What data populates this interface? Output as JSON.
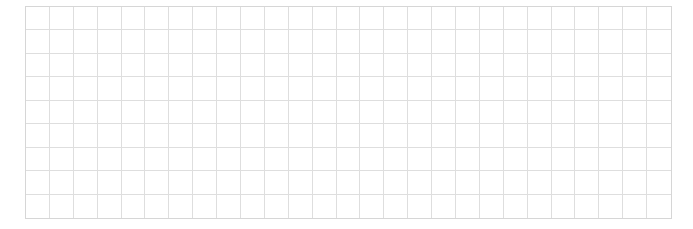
{
  "grid": {
    "columns": 27,
    "rows": 9,
    "line_color": "#dedede",
    "border_color": "#d6d6d6",
    "background": "#ffffff"
  }
}
